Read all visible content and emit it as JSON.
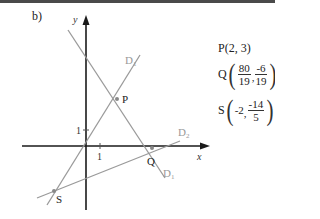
{
  "figure_label": "b)",
  "axes": {
    "x_label": "x",
    "y_label": "y",
    "x_tick": "1",
    "y_tick": "1",
    "origin_px": [
      86,
      146
    ],
    "unit_px": 15.5
  },
  "lines": [
    {
      "name": "D1",
      "label": "D",
      "sub": "1",
      "color": "#9a9a9a",
      "through": [
        "P",
        "Q"
      ]
    },
    {
      "name": "D2",
      "label": "D",
      "sub": "2",
      "color": "#9a9a9a",
      "through": [
        "S",
        "Q"
      ]
    },
    {
      "name": "D3",
      "label": "D",
      "sub": "1",
      "color": "#9a9a9a",
      "through": [
        "O",
        "P"
      ]
    }
  ],
  "points": {
    "P": {
      "label": "P",
      "coords": "(2, 3)"
    },
    "Q": {
      "label": "Q",
      "x_num": "80",
      "x_den": "19",
      "y_num": "-6",
      "y_den": "19"
    },
    "S": {
      "label": "S",
      "x": "-2",
      "y_num": "-14",
      "y_den": "5"
    }
  },
  "colors": {
    "axis": "#1a1a1a",
    "line": "#9a9a9a",
    "text": "#222222",
    "label_gray": "#999999"
  }
}
